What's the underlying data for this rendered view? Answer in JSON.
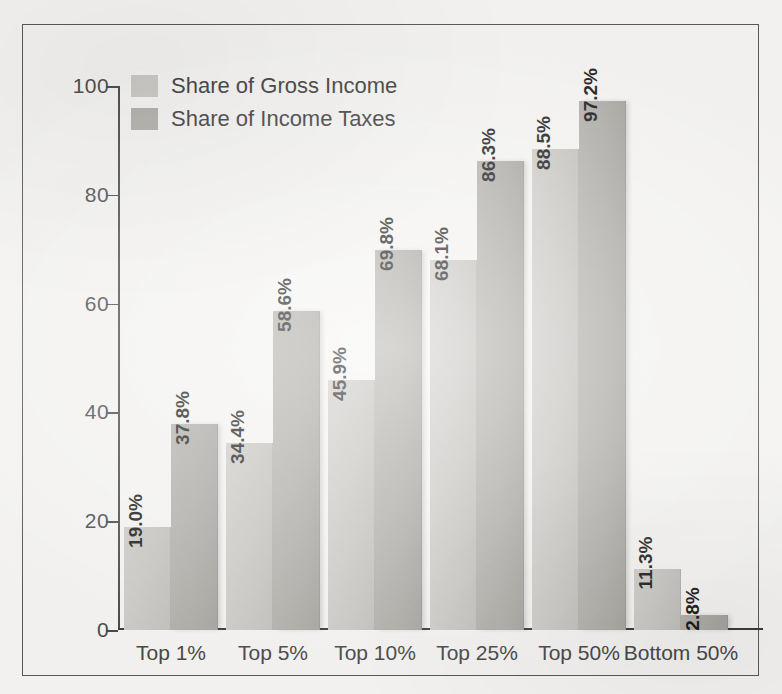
{
  "chart_data": {
    "type": "bar",
    "title": "",
    "xlabel": "",
    "ylabel": "",
    "ylim": [
      0,
      100
    ],
    "yticks": [
      "0",
      "20",
      "40",
      "60",
      "80",
      "100"
    ],
    "grid": false,
    "legend_position": "top-left",
    "categories": [
      "Top 1%",
      "Top 5%",
      "Top 10%",
      "Top 25%",
      "Top 50%",
      "Bottom 50%"
    ],
    "series": [
      {
        "name": "Share of Gross Income",
        "color": "#cbc9c5",
        "values": [
          19.0,
          34.4,
          45.9,
          68.1,
          88.5,
          11.3
        ],
        "labels": [
          "19.0%",
          "34.4%",
          "45.9%",
          "68.1%",
          "88.5%",
          "11.3%"
        ]
      },
      {
        "name": "Share of Income Taxes",
        "color": "#b1afaa",
        "values": [
          37.8,
          58.6,
          69.8,
          86.3,
          97.2,
          2.8
        ],
        "labels": [
          "37.8%",
          "58.6%",
          "69.8%",
          "86.3%",
          "97.2%",
          "2.8%"
        ]
      }
    ]
  },
  "legend": {
    "items": [
      {
        "label": "Share of Gross Income",
        "swatch": "series-1-swatch"
      },
      {
        "label": "Share of Income Taxes",
        "swatch": "series-2-swatch"
      }
    ]
  }
}
